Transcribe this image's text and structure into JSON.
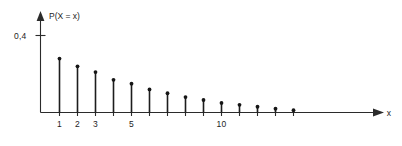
{
  "chart_data": {
    "type": "bar",
    "subtype": "stem-plot",
    "title": "",
    "subtitle": "",
    "xlabel": "x",
    "ylabel": "P(X = x)",
    "grid": false,
    "legend": false,
    "xlim": [
      0,
      17.5
    ],
    "ylim": [
      0,
      0.46
    ],
    "x": [
      1,
      2,
      3,
      4,
      5,
      6,
      7,
      8,
      9,
      10,
      11,
      12,
      13,
      14
    ],
    "values": [
      0.28,
      0.24,
      0.21,
      0.17,
      0.15,
      0.12,
      0.1,
      0.08,
      0.065,
      0.05,
      0.04,
      0.03,
      0.02,
      0.012
    ],
    "x_tick_positions": [
      1,
      2,
      3,
      4,
      5,
      6,
      7,
      8,
      9,
      10,
      11,
      12,
      13,
      14
    ],
    "x_tick_labels": [
      "1",
      "2",
      "3",
      "",
      "5",
      "",
      "",
      "",
      "",
      "10",
      "",
      "",
      "",
      ""
    ],
    "y_tick_positions": [
      0.4
    ],
    "y_tick_labels": [
      "0,4"
    ],
    "marker": "filled-circle",
    "axis_color": "#2b2b2b",
    "stem_color": "#1d1d1d"
  },
  "axes": {
    "y_axis_label": "P(X = x)",
    "x_axis_label": "x",
    "y_tick_label_04": "0,4",
    "x_tick_label_1": "1",
    "x_tick_label_2": "2",
    "x_tick_label_3": "3",
    "x_tick_label_5": "5",
    "x_tick_label_10": "10"
  }
}
